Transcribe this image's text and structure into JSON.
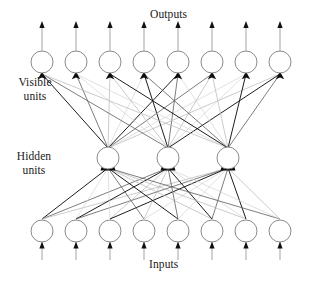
{
  "figure": {
    "kind": "neural-network-diagram",
    "width": 332,
    "height": 281,
    "background": "#ffffff"
  },
  "labels": {
    "outputs": "Outputs",
    "inputs": "Inputs",
    "visible_units": "Visible\nunits",
    "hidden_units": "Hidden\nunits"
  },
  "colors": {
    "node_stroke": "#7d7d7d",
    "node_fill": "#ffffff",
    "synapse_dark": "#111111",
    "synapse_mid": "#5c5c5c",
    "synapse_light": "#b4b4b4",
    "synapse_faint": "#d0d0d0",
    "terminal_block": "#0d0d0d",
    "text": "#1a1a1a"
  },
  "layers": [
    {
      "name": "visible-output-layer",
      "role": "visible",
      "count": 8,
      "radius": 11,
      "cy": 62,
      "cx": [
        42,
        76,
        110,
        144,
        178,
        212,
        246,
        280
      ],
      "has_output_arrow": true
    },
    {
      "name": "hidden-layer",
      "role": "hidden",
      "count": 3,
      "radius": 11,
      "cy": 158,
      "cx": [
        108,
        168,
        228
      ],
      "has_output_arrow": false
    },
    {
      "name": "input-layer",
      "role": "input",
      "count": 8,
      "radius": 11,
      "cy": 231,
      "cx": [
        42,
        76,
        110,
        144,
        178,
        212,
        246,
        280
      ],
      "has_input_arrow": true
    }
  ],
  "connections": {
    "hidden_to_visible": {
      "from": "hidden-layer",
      "to": "visible-output-layer",
      "fully_connected": true,
      "edge_count": 24,
      "terminal": "filled-arrowhead"
    },
    "input_to_hidden": {
      "from": "input-layer",
      "to": "hidden-layer",
      "fully_connected": true,
      "edge_count": 24,
      "terminal": "filled-block"
    }
  },
  "arrows": {
    "output_arrow_length": 30,
    "input_arrow_length": 18
  }
}
